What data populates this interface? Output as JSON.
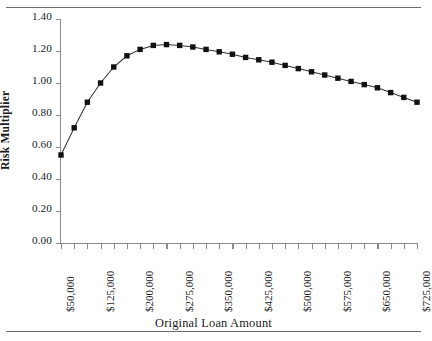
{
  "chart_data": {
    "type": "line",
    "title": "",
    "xlabel": "Original Loan Amount",
    "ylabel": "Risk Multiplier",
    "ylim": [
      0.0,
      1.4
    ],
    "ytick_labels": [
      "1.40",
      "1.20",
      "1.00",
      "0.80",
      "0.60",
      "0.40",
      "0.20",
      "0.00"
    ],
    "ytick_values": [
      1.4,
      1.2,
      1.0,
      0.8,
      0.6,
      0.4,
      0.2,
      0.0
    ],
    "xlim": [
      50000,
      725000
    ],
    "xtick_step": 25000,
    "xtick_labels": [
      "$50,000",
      "$125,000",
      "$200,000",
      "$275,000",
      "$350,000",
      "$425,000",
      "$500,000",
      "$575,000",
      "$650,000",
      "$725,000"
    ],
    "xtick_label_values": [
      50000,
      125000,
      200000,
      275000,
      350000,
      425000,
      500000,
      575000,
      650000,
      725000
    ],
    "grid": false,
    "legend": false,
    "marker": "square",
    "series_color": "#111111",
    "x": [
      50000,
      75000,
      100000,
      125000,
      150000,
      175000,
      200000,
      225000,
      250000,
      275000,
      300000,
      325000,
      350000,
      375000,
      400000,
      425000,
      450000,
      475000,
      500000,
      525000,
      550000,
      575000,
      600000,
      625000,
      650000,
      675000,
      700000,
      725000
    ],
    "values": [
      0.55,
      0.72,
      0.88,
      1.0,
      1.1,
      1.17,
      1.21,
      1.235,
      1.24,
      1.235,
      1.225,
      1.21,
      1.195,
      1.18,
      1.16,
      1.145,
      1.13,
      1.11,
      1.09,
      1.07,
      1.05,
      1.03,
      1.01,
      0.99,
      0.97,
      0.94,
      0.91,
      0.88
    ]
  },
  "figure": {
    "top_rule": "",
    "bottom_rule": ""
  }
}
